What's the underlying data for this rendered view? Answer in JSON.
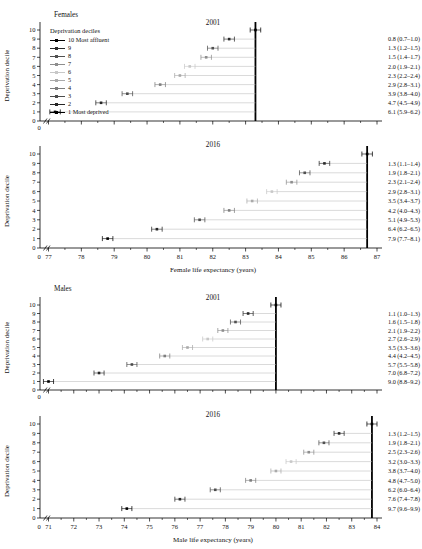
{
  "y_axis": {
    "label": "Deprivation decile",
    "ticks": [
      0,
      1,
      2,
      3,
      4,
      5,
      6,
      7,
      8,
      9,
      10
    ]
  },
  "legend": {
    "title": "Deprivation deciles",
    "items": [
      {
        "decile": 10,
        "label": "10 Most affluent"
      },
      {
        "decile": 9,
        "label": "9"
      },
      {
        "decile": 8,
        "label": "8"
      },
      {
        "decile": 7,
        "label": "7"
      },
      {
        "decile": 6,
        "label": "6"
      },
      {
        "decile": 5,
        "label": "5"
      },
      {
        "decile": 4,
        "label": "4"
      },
      {
        "decile": 3,
        "label": "3"
      },
      {
        "decile": 2,
        "label": "2"
      },
      {
        "decile": 1,
        "label": "1 Most deprived"
      }
    ]
  },
  "decile_colors": {
    "10": "#000000",
    "9": "#2a2a2a",
    "8": "#505050",
    "7": "#8e8e8e",
    "6": "#c8c8c8",
    "5": "#aaaaaa",
    "4": "#7e7e7e",
    "3": "#4c4c4c",
    "2": "#262626",
    "1": "#000000"
  },
  "connector_color": "#bcbcbc",
  "chart_data": [
    {
      "id": "females-2001",
      "type": "scatter",
      "group_label": "Females",
      "title": "2001",
      "x_min": 77,
      "x_max": 87,
      "ticks": [
        77,
        78,
        79,
        80,
        81,
        82,
        83,
        84,
        85,
        86,
        87
      ],
      "show_tick_labels": false,
      "zero_label": "0",
      "axis_break": true,
      "x_axis_label": "",
      "ci_half": 0.16,
      "deciles": [
        10,
        9,
        8,
        7,
        6,
        5,
        4,
        3,
        2,
        1
      ],
      "values": [
        83.3,
        82.5,
        82.0,
        81.8,
        81.3,
        81.0,
        80.4,
        79.4,
        78.6,
        77.2
      ],
      "annotations": [
        "0.8 (0.7–1.0)",
        "1.3 (1.2–1.5)",
        "1.5 (1.4–1.7)",
        "2.0 (1.9–2.1)",
        "2.3 (2.2–2.4)",
        "2.9 (2.8–3.1)",
        "3.9 (3.8–4.0)",
        "4.7 (4.5–4.9)",
        "6.1 (5.9–6.2)"
      ]
    },
    {
      "id": "females-2016",
      "type": "scatter",
      "group_label": "",
      "title": "2016",
      "x_min": 77,
      "x_max": 87,
      "ticks": [
        77,
        78,
        79,
        80,
        81,
        82,
        83,
        84,
        85,
        86,
        87
      ],
      "show_tick_labels": true,
      "zero_label": "0",
      "axis_break": true,
      "x_axis_label": "Female life expectancy (years)",
      "ci_half": 0.16,
      "deciles": [
        10,
        9,
        8,
        7,
        6,
        5,
        4,
        3,
        2,
        1
      ],
      "values": [
        86.7,
        85.4,
        84.8,
        84.4,
        83.8,
        83.2,
        82.5,
        81.6,
        80.3,
        78.8
      ],
      "annotations": [
        "1.3 (1.1–1.4)",
        "1.9 (1.8–2.1)",
        "2.3 (2.1–2.4)",
        "2.9 (2.8–3.1)",
        "3.5 (3.4–3.7)",
        "4.2 (4.0–4.3)",
        "5.1 (4.9–5.3)",
        "6.4 (6.2–6.5)",
        "7.9 (7.7–8.1)"
      ]
    },
    {
      "id": "males-2001",
      "type": "scatter",
      "group_label": "Males",
      "title": "2001",
      "x_min": 71,
      "x_max": 84,
      "ticks": [
        71,
        72,
        73,
        74,
        75,
        76,
        77,
        78,
        79,
        80,
        81,
        82,
        83,
        84
      ],
      "show_tick_labels": false,
      "zero_label": "0",
      "axis_break": true,
      "x_axis_label": "",
      "ci_half": 0.2,
      "deciles": [
        10,
        9,
        8,
        7,
        6,
        5,
        4,
        3,
        2,
        1
      ],
      "values": [
        80.0,
        78.9,
        78.4,
        77.9,
        77.3,
        76.5,
        75.6,
        74.3,
        73.0,
        71.0
      ],
      "annotations": [
        "1.1 (1.0–1.3)",
        "1.6 (1.5–1.8)",
        "2.1 (1.9–2.2)",
        "2.7 (2.6–2.9)",
        "3.5 (3.3–3.6)",
        "4.4 (4.2–4.5)",
        "5.7 (5.5–5.8)",
        "7.0 (6.8–7.2)",
        "9.0 (8.8–9.2)"
      ]
    },
    {
      "id": "males-2016",
      "type": "scatter",
      "group_label": "",
      "title": "2016",
      "x_min": 71,
      "x_max": 84,
      "ticks": [
        71,
        72,
        73,
        74,
        75,
        76,
        77,
        78,
        79,
        80,
        81,
        82,
        83,
        84
      ],
      "show_tick_labels": true,
      "zero_label": "0",
      "axis_break": true,
      "x_axis_label": "Male life expectancy (years)",
      "ci_half": 0.2,
      "deciles": [
        10,
        9,
        8,
        7,
        6,
        5,
        4,
        3,
        2,
        1
      ],
      "values": [
        83.8,
        82.5,
        81.9,
        81.3,
        80.6,
        80.0,
        79.0,
        77.6,
        76.2,
        74.1
      ],
      "annotations": [
        "1.3 (1.2–1.5)",
        "1.9 (1.8–2.1)",
        "2.5 (2.3–2.6)",
        "3.2 (3.0–3.3)",
        "3.8 (3.7–4.0)",
        "4.8 (4.7–5.0)",
        "6.2 (6.0–6.4)",
        "7.6 (7.4–7.8)",
        "9.7 (9.6–9.9)"
      ]
    }
  ]
}
